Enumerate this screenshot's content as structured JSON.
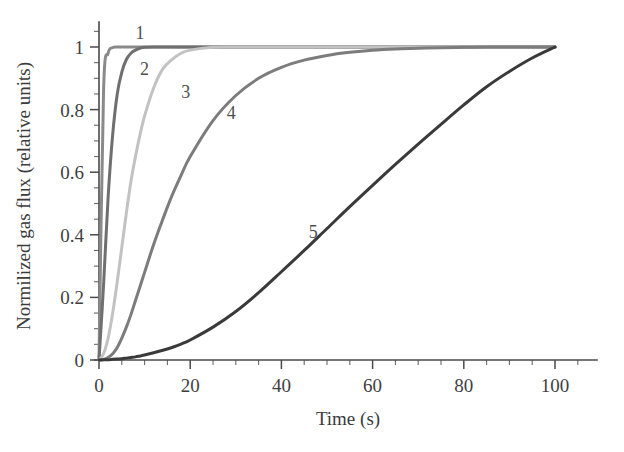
{
  "chart_data": {
    "type": "line",
    "title": "",
    "xlabel": "Time (s)",
    "ylabel": "Normilized gas flux (relative units)",
    "xlim": [
      0,
      105
    ],
    "ylim": [
      0,
      1.06
    ],
    "grid": false,
    "legend": "inline-curve-labels",
    "x_ticks_major": [
      0,
      20,
      40,
      60,
      80,
      100
    ],
    "x_ticklabels": [
      "0",
      "20",
      "40",
      "60",
      "80",
      "100"
    ],
    "x_tick_minor_step": 5,
    "y_ticks_major": [
      0,
      0.2,
      0.4,
      0.6,
      0.8,
      1
    ],
    "y_ticklabels": [
      "0",
      "0.2",
      "0.4",
      "0.6",
      "0.8",
      "1"
    ],
    "y_tick_minor_step": 0.05,
    "x": [
      0,
      1,
      2,
      3,
      4,
      5,
      6,
      7,
      8,
      9,
      10,
      12,
      14,
      16,
      18,
      20,
      25,
      30,
      35,
      40,
      45,
      50,
      55,
      60,
      65,
      70,
      75,
      80,
      85,
      90,
      95,
      100
    ],
    "series": [
      {
        "name": "1",
        "label": "1",
        "color": "#8a8a8a",
        "linewidth": 3.0,
        "label_x": 9,
        "label_y": 1.045,
        "values": [
          0,
          0.86,
          0.98,
          0.998,
          1,
          1,
          1,
          1,
          1,
          1,
          1,
          1,
          1,
          1,
          1,
          1,
          1,
          1,
          1,
          1,
          1,
          1,
          1,
          1,
          1,
          1,
          1,
          1,
          1,
          1,
          1,
          1
        ]
      },
      {
        "name": "2",
        "label": "2",
        "color": "#6f6f6f",
        "linewidth": 3.0,
        "label_x": 10,
        "label_y": 0.93,
        "values": [
          0,
          0.24,
          0.52,
          0.72,
          0.85,
          0.92,
          0.96,
          0.98,
          0.99,
          0.996,
          0.999,
          1,
          1,
          1,
          1,
          1,
          1,
          1,
          1,
          1,
          1,
          1,
          1,
          1,
          1,
          1,
          1,
          1,
          1,
          1,
          1,
          1
        ]
      },
      {
        "name": "3",
        "label": "3",
        "color": "#c2c2c2",
        "linewidth": 3.0,
        "label_x": 19,
        "label_y": 0.855,
        "values": [
          0,
          0.02,
          0.07,
          0.15,
          0.25,
          0.36,
          0.47,
          0.57,
          0.65,
          0.72,
          0.78,
          0.87,
          0.93,
          0.96,
          0.98,
          0.99,
          0.999,
          1,
          1,
          1,
          1,
          1,
          1,
          1,
          1,
          1,
          1,
          1,
          1,
          1,
          1,
          1
        ]
      },
      {
        "name": "4",
        "label": "4",
        "color": "#7c7c7c",
        "linewidth": 3.0,
        "label_x": 29,
        "label_y": 0.79,
        "values": [
          0,
          0.002,
          0.008,
          0.02,
          0.04,
          0.07,
          0.105,
          0.145,
          0.19,
          0.235,
          0.28,
          0.37,
          0.45,
          0.525,
          0.59,
          0.65,
          0.765,
          0.845,
          0.9,
          0.935,
          0.958,
          0.973,
          0.983,
          0.99,
          0.994,
          0.996,
          0.998,
          0.999,
          1,
          1,
          1,
          1
        ]
      },
      {
        "name": "5",
        "label": "5",
        "color": "#3a3a3a",
        "linewidth": 3.0,
        "label_x": 47,
        "label_y": 0.41,
        "values": [
          0,
          0.0005,
          0.001,
          0.002,
          0.003,
          0.004,
          0.006,
          0.008,
          0.01,
          0.013,
          0.016,
          0.023,
          0.031,
          0.04,
          0.051,
          0.064,
          0.105,
          0.155,
          0.215,
          0.282,
          0.35,
          0.42,
          0.49,
          0.558,
          0.625,
          0.69,
          0.753,
          0.815,
          0.873,
          0.922,
          0.965,
          1
        ]
      }
    ]
  }
}
